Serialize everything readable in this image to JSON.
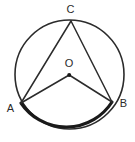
{
  "figure": {
    "background_color": "#ffffff",
    "stroke_color": "#2b2b2b",
    "circle": {
      "name": "circle-O",
      "center_x": 69.5,
      "center_y": 74.5,
      "radius": 54.5,
      "stroke_width": 1.6
    },
    "center_point": {
      "label": "O",
      "x": 69.2,
      "y": 75.0,
      "dot_radius": 2.0,
      "label_x": 69.0,
      "label_y": 67.0
    },
    "points": [
      {
        "id": "A",
        "label": "A",
        "x": 21.0,
        "y": 103.0,
        "label_x": 10.5,
        "label_y": 112.0
      },
      {
        "id": "B",
        "label": "B",
        "x": 112.0,
        "y": 102.0,
        "label_x": 123.5,
        "label_y": 107.0
      },
      {
        "id": "C",
        "label": "C",
        "x": 71.0,
        "y": 21.0,
        "label_x": 70.5,
        "label_y": 13.0
      }
    ],
    "segments": [
      {
        "id": "OA",
        "name": "radius-o-to-a",
        "from": "O",
        "to": "A",
        "stroke_width": 1.5
      },
      {
        "id": "OB",
        "name": "radius-o-to-b",
        "from": "O",
        "to": "B",
        "stroke_width": 1.5
      },
      {
        "id": "CA",
        "name": "chord-c-to-a",
        "from": "C",
        "to": "A",
        "stroke_width": 1.5
      },
      {
        "id": "CB",
        "name": "chord-c-to-b",
        "from": "C",
        "to": "B",
        "stroke_width": 1.5
      }
    ],
    "highlighted_arc": {
      "id": "arc-AB",
      "name": "bold-arc-a-to-b",
      "from": "A",
      "to": "B",
      "path": "M 21 103 A 54.5 54.5 0 0 0 112 102",
      "stroke_width": 3.2
    }
  }
}
